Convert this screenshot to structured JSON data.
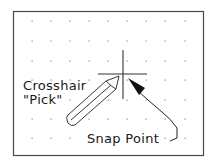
{
  "diagram": {
    "frame": {
      "x": 13,
      "y": 11,
      "width": 190,
      "height": 144,
      "stroke": "#4a4a4a"
    },
    "grid": {
      "dot_color": "#8a8a8a",
      "columns_x": [
        32,
        51,
        70,
        89,
        108,
        127,
        146,
        165,
        185
      ],
      "rows_y": [
        21,
        41,
        61,
        80,
        100,
        119,
        138
      ]
    },
    "crosshair": {
      "center": [
        123,
        74
      ],
      "vertical": {
        "x": 123,
        "y1": 50,
        "y2": 99
      },
      "horizontal": {
        "y": 74,
        "x1": 98,
        "x2": 147
      },
      "stroke": "#333333"
    },
    "labels": {
      "crosshair_line1": "Crosshair",
      "crosshair_line2": "\"Pick\"",
      "snap_point": "Snap Point"
    },
    "text_color": "#1a1a1a",
    "line_color": "#222222"
  }
}
